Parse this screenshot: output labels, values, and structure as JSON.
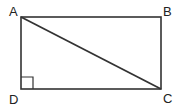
{
  "diagram": {
    "type": "geometry",
    "shape": "rectangle",
    "vertices": [
      {
        "label": "A",
        "x": 21,
        "y": 17,
        "label_x": 9,
        "label_y": 16
      },
      {
        "label": "B",
        "x": 161,
        "y": 17,
        "label_x": 163,
        "label_y": 16
      },
      {
        "label": "C",
        "x": 161,
        "y": 89,
        "label_x": 163,
        "label_y": 103
      },
      {
        "label": "D",
        "x": 21,
        "y": 89,
        "label_x": 9,
        "label_y": 104
      }
    ],
    "diagonal": {
      "from": "A",
      "to": "C"
    },
    "right_angle_marker": {
      "at": "D",
      "size": 12
    },
    "stroke_color": "#333333"
  }
}
